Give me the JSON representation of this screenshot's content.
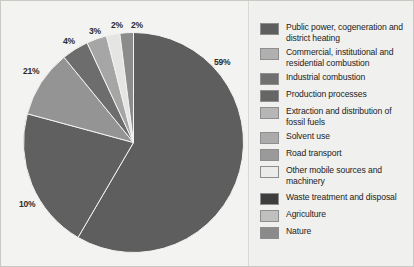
{
  "chart_data": {
    "type": "pie",
    "title": "",
    "subtitle": "",
    "xlabel": "",
    "ylabel": "",
    "legend_position": "right",
    "grid": false,
    "units": "%",
    "start_angle_deg": 0,
    "direction": "clockwise",
    "categories": [
      "Public power, cogeneration and district heating",
      "Commercial, institutional and residential combustion",
      "Industrial combustion",
      "Production processes",
      "Extraction and distribution of fossil fuels",
      "Solvent use",
      "Road transport",
      "Other mobile sources and machinery",
      "Waste treatment and disposal",
      "Agriculture",
      "Nature"
    ],
    "values": [
      59,
      21,
      10,
      4,
      3,
      2,
      2,
      0,
      0,
      0,
      0
    ],
    "colors": [
      "#5e5e5e",
      "#808080",
      "#8f8f8f",
      "#6f6f6f",
      "#adadad",
      "#bdbdbd",
      "#9a9a9a",
      "#e8e8e6",
      "#3f3f3f",
      "#b5b5b5",
      "#7a7a7a"
    ],
    "slices": [
      {
        "label": "59%",
        "value": 59,
        "category": "Public power, cogeneration and district heating",
        "color": "#5e5e5e"
      },
      {
        "label": "21%",
        "value": 21,
        "category": "Commercial, institutional and residential combustion",
        "color": "#606060"
      },
      {
        "label": "10%",
        "value": 10,
        "category": "Industrial combustion",
        "color": "#949494"
      },
      {
        "label": "4%",
        "value": 4,
        "category": "Production processes",
        "color": "#6d6d6d"
      },
      {
        "label": "3%",
        "value": 3,
        "category": "Extraction and distribution of fossil fuels",
        "color": "#a6a6a6"
      },
      {
        "label": "2%",
        "value": 2,
        "category": "Solvent use",
        "color": "#e5e5e3"
      },
      {
        "label": "2%",
        "value": 2,
        "category": "Road transport",
        "color": "#8c8c8c"
      }
    ]
  },
  "chart": {
    "labels": {
      "p59": "59%",
      "p21": "21%",
      "p10": "10%",
      "p4": "4%",
      "p3": "3%",
      "p2a": "2%",
      "p2b": "2%"
    }
  },
  "legend": {
    "items": [
      {
        "label": "Public power, cogeneration and district heating",
        "color": "#5e5e5e"
      },
      {
        "label": "Commercial, institutional and residential combustion",
        "color": "#b0b0b0"
      },
      {
        "label": "Industrial combustion",
        "color": "#707070"
      },
      {
        "label": "Production processes",
        "color": "#666666"
      },
      {
        "label": "Extraction and distribution of fossil fuels",
        "color": "#b6b6b6"
      },
      {
        "label": "Solvent use",
        "color": "#ababab"
      },
      {
        "label": "Road transport",
        "color": "#9a9a9a"
      },
      {
        "label": "Other mobile sources and machinery",
        "color": "#ebebe9"
      },
      {
        "label": "Waste treatment and disposal",
        "color": "#3d3d3d"
      },
      {
        "label": "Agriculture",
        "color": "#c0c0c0"
      },
      {
        "label": "Nature",
        "color": "#8b8b8b"
      }
    ]
  }
}
